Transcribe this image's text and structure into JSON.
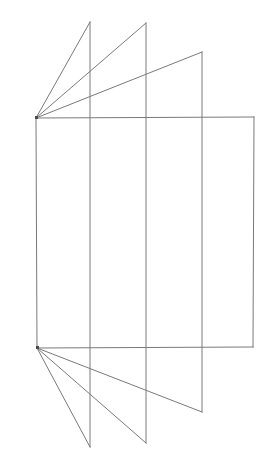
{
  "figure": {
    "background_color": "#ffffff",
    "stroke_color": "#7a7a7a",
    "stroke_width_px": 1,
    "canvas": {
      "width": 271,
      "height": 465
    },
    "vertices": {
      "top_apex": {
        "name": "top-left-apex",
        "x": 36,
        "y": 118
      },
      "bottom_apex": {
        "name": "bottom-left-apex",
        "x": 37,
        "y": 348
      },
      "top_right": {
        "name": "top-right-corner",
        "x": 254,
        "y": 117
      },
      "bottom_right": {
        "name": "bottom-right-corner",
        "x": 253,
        "y": 347
      }
    },
    "fold_lines": [
      {
        "name": "fold-line-1",
        "x": 90,
        "top_y": 22,
        "bottom_y": 447
      },
      {
        "name": "fold-line-2",
        "x": 146,
        "top_y": 23,
        "bottom_y": 443
      },
      {
        "name": "fold-line-3",
        "x": 202,
        "top_y": 52,
        "bottom_y": 412
      }
    ],
    "body_outline": {
      "name": "body-outline",
      "points": "36,118 254,117 253,347 37,348"
    },
    "top_rays": [
      {
        "name": "top-ray-1",
        "x1": 36,
        "y1": 118,
        "x2": 90,
        "y2": 22
      },
      {
        "name": "top-ray-2",
        "x1": 36,
        "y1": 118,
        "x2": 146,
        "y2": 23
      },
      {
        "name": "top-ray-3",
        "x1": 36,
        "y1": 118,
        "x2": 202,
        "y2": 52
      }
    ],
    "bottom_rays": [
      {
        "name": "bottom-ray-1",
        "x1": 37,
        "y1": 348,
        "x2": 90,
        "y2": 447
      },
      {
        "name": "bottom-ray-2",
        "x1": 37,
        "y1": 348,
        "x2": 146,
        "y2": 443
      },
      {
        "name": "bottom-ray-3",
        "x1": 37,
        "y1": 348,
        "x2": 202,
        "y2": 412
      }
    ]
  }
}
